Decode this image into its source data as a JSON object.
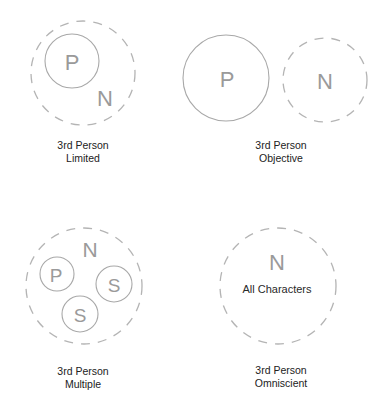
{
  "colors": {
    "circle_stroke": "#a8a8a8",
    "dashed_stroke": "#b4b4b4",
    "letter": "#9a9a9a",
    "caption_text": "#222222"
  },
  "diagrams": [
    {
      "id": "limited",
      "caption_line1": "3rd Person",
      "caption_line2": "Limited",
      "labels": {
        "p": "P",
        "n": "N"
      }
    },
    {
      "id": "objective",
      "caption_line1": "3rd Person",
      "caption_line2": "Objective",
      "labels": {
        "p": "P",
        "n": "N"
      }
    },
    {
      "id": "multiple",
      "caption_line1": "3rd Person",
      "caption_line2": "Multiple",
      "labels": {
        "n": "N",
        "p": "P",
        "s1": "S",
        "s2": "S"
      }
    },
    {
      "id": "omniscient",
      "caption_line1": "3rd Person",
      "caption_line2": "Omniscient",
      "labels": {
        "n": "N",
        "inner": "All Characters"
      }
    }
  ]
}
